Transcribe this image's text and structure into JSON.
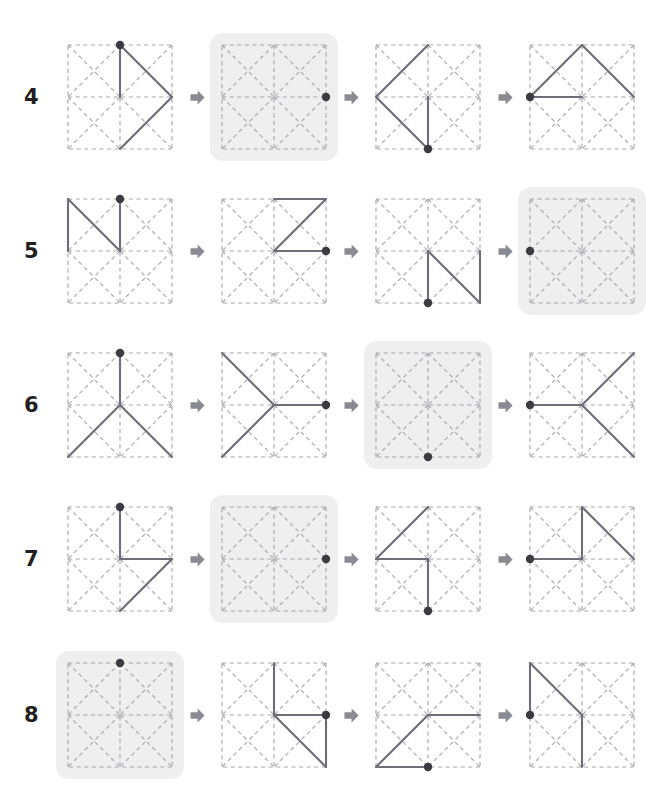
{
  "page": {
    "background_color": "#ffffff",
    "highlight_color": "#efefef",
    "dash_color": "#a8a8ae",
    "path_color": "#6e6e78",
    "dot_color": "#3b3b42",
    "arrow_color": "#8a8a92"
  },
  "grid": {
    "size": 4,
    "cells": 2,
    "description": "square divided into 2x2 cells, every cell crossed by both diagonals, all strokes dashed"
  },
  "icons": {
    "arrow": "right-arrow-icon",
    "dot": "endpoint-dot-icon"
  },
  "rows": [
    {
      "number": "4",
      "panels": [
        {
          "highlighted": false,
          "dot": [
            2,
            0
          ],
          "segments": [
            [
              [
                2,
                0
              ],
              [
                2,
                2
              ]
            ],
            [
              [
                2,
                0
              ],
              [
                4,
                2
              ]
            ],
            [
              [
                4,
                2
              ],
              [
                2,
                4
              ]
            ]
          ]
        },
        {
          "highlighted": true,
          "dot": [
            4,
            2
          ],
          "segments": []
        },
        {
          "highlighted": false,
          "dot": [
            2,
            4
          ],
          "segments": [
            [
              [
                2,
                0
              ],
              [
                0,
                2
              ]
            ],
            [
              [
                0,
                2
              ],
              [
                2,
                4
              ]
            ],
            [
              [
                2,
                2
              ],
              [
                2,
                4
              ]
            ]
          ]
        },
        {
          "highlighted": false,
          "dot": [
            0,
            2
          ],
          "segments": [
            [
              [
                0,
                2
              ],
              [
                2,
                0
              ]
            ],
            [
              [
                2,
                0
              ],
              [
                4,
                2
              ]
            ],
            [
              [
                0,
                2
              ],
              [
                2,
                2
              ]
            ]
          ]
        }
      ]
    },
    {
      "number": "5",
      "panels": [
        {
          "highlighted": false,
          "dot": [
            2,
            0
          ],
          "segments": [
            [
              [
                0,
                0
              ],
              [
                0,
                2
              ]
            ],
            [
              [
                0,
                0
              ],
              [
                2,
                2
              ]
            ],
            [
              [
                2,
                2
              ],
              [
                2,
                0
              ]
            ]
          ]
        },
        {
          "highlighted": false,
          "dot": [
            4,
            2
          ],
          "segments": [
            [
              [
                2,
                0
              ],
              [
                4,
                0
              ]
            ],
            [
              [
                4,
                0
              ],
              [
                2,
                2
              ]
            ],
            [
              [
                2,
                2
              ],
              [
                4,
                2
              ]
            ]
          ]
        },
        {
          "highlighted": false,
          "dot": [
            2,
            4
          ],
          "segments": [
            [
              [
                4,
                2
              ],
              [
                4,
                4
              ]
            ],
            [
              [
                2,
                2
              ],
              [
                4,
                4
              ]
            ],
            [
              [
                2,
                2
              ],
              [
                2,
                4
              ]
            ]
          ]
        },
        {
          "highlighted": true,
          "dot": [
            0,
            2
          ],
          "segments": []
        }
      ]
    },
    {
      "number": "6",
      "panels": [
        {
          "highlighted": false,
          "dot": [
            2,
            0
          ],
          "segments": [
            [
              [
                2,
                0
              ],
              [
                2,
                2
              ]
            ],
            [
              [
                2,
                2
              ],
              [
                0,
                4
              ]
            ],
            [
              [
                2,
                2
              ],
              [
                4,
                4
              ]
            ]
          ]
        },
        {
          "highlighted": false,
          "dot": [
            4,
            2
          ],
          "segments": [
            [
              [
                4,
                2
              ],
              [
                2,
                2
              ]
            ],
            [
              [
                2,
                2
              ],
              [
                0,
                0
              ]
            ],
            [
              [
                2,
                2
              ],
              [
                0,
                4
              ]
            ]
          ]
        },
        {
          "highlighted": true,
          "dot": [
            2,
            4
          ],
          "segments": []
        },
        {
          "highlighted": false,
          "dot": [
            0,
            2
          ],
          "segments": [
            [
              [
                0,
                2
              ],
              [
                2,
                2
              ]
            ],
            [
              [
                2,
                2
              ],
              [
                4,
                0
              ]
            ],
            [
              [
                2,
                2
              ],
              [
                4,
                4
              ]
            ]
          ]
        }
      ]
    },
    {
      "number": "7",
      "panels": [
        {
          "highlighted": false,
          "dot": [
            2,
            0
          ],
          "segments": [
            [
              [
                2,
                0
              ],
              [
                2,
                2
              ]
            ],
            [
              [
                2,
                2
              ],
              [
                4,
                2
              ]
            ],
            [
              [
                4,
                2
              ],
              [
                2,
                4
              ]
            ]
          ]
        },
        {
          "highlighted": true,
          "dot": [
            4,
            2
          ],
          "segments": []
        },
        {
          "highlighted": false,
          "dot": [
            2,
            4
          ],
          "segments": [
            [
              [
                2,
                0
              ],
              [
                0,
                2
              ]
            ],
            [
              [
                0,
                2
              ],
              [
                2,
                2
              ]
            ],
            [
              [
                2,
                2
              ],
              [
                2,
                4
              ]
            ]
          ]
        },
        {
          "highlighted": false,
          "dot": [
            0,
            2
          ],
          "segments": [
            [
              [
                0,
                2
              ],
              [
                2,
                2
              ]
            ],
            [
              [
                2,
                2
              ],
              [
                2,
                0
              ]
            ],
            [
              [
                2,
                0
              ],
              [
                4,
                2
              ]
            ]
          ]
        }
      ]
    },
    {
      "number": "8",
      "panels": [
        {
          "highlighted": true,
          "dot": [
            2,
            0
          ],
          "segments": []
        },
        {
          "highlighted": false,
          "dot": [
            4,
            2
          ],
          "segments": [
            [
              [
                2,
                0
              ],
              [
                2,
                2
              ]
            ],
            [
              [
                2,
                2
              ],
              [
                4,
                2
              ]
            ],
            [
              [
                2,
                2
              ],
              [
                4,
                4
              ]
            ],
            [
              [
                4,
                4
              ],
              [
                4,
                2
              ]
            ]
          ]
        },
        {
          "highlighted": false,
          "dot": [
            2,
            4
          ],
          "segments": [
            [
              [
                4,
                2
              ],
              [
                2,
                2
              ]
            ],
            [
              [
                2,
                2
              ],
              [
                0,
                4
              ]
            ],
            [
              [
                0,
                4
              ],
              [
                2,
                4
              ]
            ]
          ]
        },
        {
          "highlighted": false,
          "dot": [
            0,
            2
          ],
          "segments": [
            [
              [
                0,
                0
              ],
              [
                0,
                2
              ]
            ],
            [
              [
                0,
                0
              ],
              [
                2,
                2
              ]
            ],
            [
              [
                2,
                2
              ],
              [
                2,
                4
              ]
            ]
          ]
        }
      ]
    }
  ]
}
